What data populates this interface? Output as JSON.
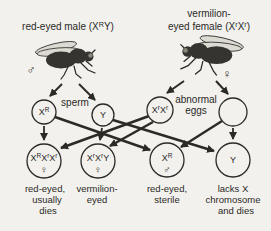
{
  "colors": {
    "background": "#f2f1ee",
    "ink": "#2b2a26",
    "wing": "#dcdad2",
    "fly_body": "#363430"
  },
  "parents": {
    "male": {
      "label_rich": [
        {
          "t": "red-eyed male (X"
        },
        {
          "t": "R",
          "sup": true
        },
        {
          "t": "Y)"
        }
      ],
      "symbol": "♂"
    },
    "female": {
      "label_line1": "vermilion-",
      "label_line2_rich": [
        {
          "t": "eyed female (X"
        },
        {
          "t": "r",
          "sup": true
        },
        {
          "t": "X"
        },
        {
          "t": "r",
          "sup": true
        },
        {
          "t": ")"
        }
      ],
      "symbol": "♀"
    }
  },
  "gametes": {
    "sperm_label": "sperm",
    "eggs_label_line1": "abnormal",
    "eggs_label_line2": "eggs",
    "sperm1_rich": [
      {
        "t": "X"
      },
      {
        "t": "R",
        "sup": true
      }
    ],
    "sperm2_label": "Y",
    "egg1_rich": [
      {
        "t": "X"
      },
      {
        "t": "r",
        "sup": true
      },
      {
        "t": "X"
      },
      {
        "t": "r",
        "sup": true
      }
    ],
    "egg2_label": ""
  },
  "offspring": [
    {
      "genotype_rich": [
        {
          "t": "X"
        },
        {
          "t": "R",
          "sup": true
        },
        {
          "t": "X"
        },
        {
          "t": "r",
          "sup": true
        },
        {
          "t": "X"
        },
        {
          "t": "r",
          "sup": true
        }
      ],
      "symbol": "♀",
      "lines": [
        "red-eyed,",
        "usually",
        "dies"
      ]
    },
    {
      "genotype_rich": [
        {
          "t": "X"
        },
        {
          "t": "r",
          "sup": true
        },
        {
          "t": "X"
        },
        {
          "t": "r",
          "sup": true
        },
        {
          "t": "Y"
        }
      ],
      "symbol": "♀",
      "lines": [
        "vermilion-",
        "eyed"
      ]
    },
    {
      "genotype_rich": [
        {
          "t": "X"
        },
        {
          "t": "R",
          "sup": true
        }
      ],
      "symbol": "♂",
      "lines": [
        "red-eyed,",
        "sterile"
      ]
    },
    {
      "genotype_rich": [
        {
          "t": "Y"
        }
      ],
      "symbol": "",
      "lines": [
        "lacks X",
        "chromosome",
        "and dies"
      ]
    }
  ]
}
